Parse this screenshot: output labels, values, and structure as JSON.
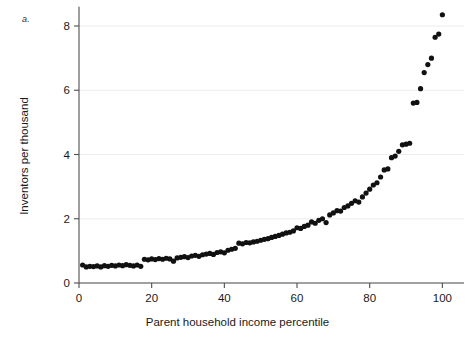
{
  "figure": {
    "panel_label": "a.",
    "background": "#ffffff",
    "marker_color": "#111111",
    "axis_color": "#4d4d4d",
    "grid_color": "#e9e9e9"
  },
  "chart_data": {
    "type": "scatter",
    "title": "",
    "subtitle": "",
    "xlabel": "Parent household income percentile",
    "ylabel": "Inventors per thousand",
    "xlim": [
      0,
      101
    ],
    "ylim": [
      0,
      8.6
    ],
    "xticks": [
      0,
      20,
      40,
      60,
      80,
      100
    ],
    "xticklabels": [
      "0",
      "20",
      "40",
      "60",
      "80",
      "100"
    ],
    "yticks": [
      0,
      2,
      4,
      6,
      8
    ],
    "yticklabels": [
      "0",
      "2",
      "4",
      "6",
      "8"
    ],
    "grid": "horizontal",
    "legend": "none",
    "annotations": [
      "a."
    ],
    "series": [
      {
        "name": "Inventors per thousand by parent income percentile",
        "marker": "filled-circle",
        "color": "#111111",
        "x": [
          1,
          2,
          3,
          4,
          5,
          6,
          7,
          8,
          9,
          10,
          11,
          12,
          13,
          14,
          15,
          16,
          17,
          18,
          19,
          20,
          21,
          22,
          23,
          24,
          25,
          26,
          27,
          28,
          29,
          30,
          31,
          32,
          33,
          34,
          35,
          36,
          37,
          38,
          39,
          40,
          41,
          42,
          43,
          44,
          45,
          46,
          47,
          48,
          49,
          50,
          51,
          52,
          53,
          54,
          55,
          56,
          57,
          58,
          59,
          60,
          61,
          62,
          63,
          64,
          65,
          66,
          67,
          68,
          69,
          70,
          71,
          72,
          73,
          74,
          75,
          76,
          77,
          78,
          79,
          80,
          81,
          82,
          83,
          84,
          85,
          86,
          87,
          88,
          89,
          90,
          91,
          92,
          93,
          94,
          95,
          96,
          97,
          98,
          99,
          100
        ],
        "y": [
          0.56,
          0.5,
          0.52,
          0.51,
          0.53,
          0.5,
          0.54,
          0.52,
          0.55,
          0.53,
          0.56,
          0.54,
          0.57,
          0.55,
          0.53,
          0.56,
          0.52,
          0.74,
          0.72,
          0.75,
          0.73,
          0.76,
          0.74,
          0.77,
          0.75,
          0.68,
          0.78,
          0.8,
          0.82,
          0.79,
          0.84,
          0.86,
          0.83,
          0.88,
          0.9,
          0.92,
          0.89,
          0.95,
          0.97,
          0.94,
          1.02,
          1.05,
          1.08,
          1.24,
          1.22,
          1.26,
          1.25,
          1.28,
          1.3,
          1.33,
          1.36,
          1.38,
          1.42,
          1.45,
          1.48,
          1.52,
          1.56,
          1.58,
          1.62,
          1.72,
          1.7,
          1.76,
          1.8,
          1.9,
          1.86,
          1.95,
          2.0,
          1.88,
          2.12,
          2.18,
          2.25,
          2.24,
          2.35,
          2.4,
          2.48,
          2.56,
          2.52,
          2.68,
          2.8,
          2.92,
          3.05,
          3.12,
          3.3,
          3.52,
          3.55,
          3.9,
          3.95,
          4.1,
          4.3,
          4.32,
          4.35,
          5.6,
          5.62,
          6.05,
          6.55,
          6.8,
          7.0,
          7.65,
          7.75,
          8.35
        ]
      }
    ]
  }
}
